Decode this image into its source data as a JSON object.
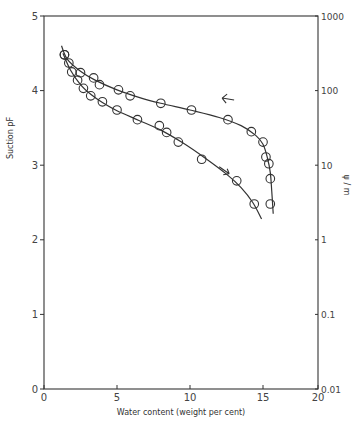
{
  "chart_data": {
    "type": "line",
    "title": "",
    "xlabel": "Water content (weight per cent)",
    "ylabel": "Suction pF",
    "y2label": "ψ / m",
    "xlim": [
      0,
      20
    ],
    "ylim": [
      0,
      5
    ],
    "x_ticks": [
      0,
      5,
      10,
      15,
      20
    ],
    "x_tick_labels": [
      "0",
      "5",
      "10",
      "15",
      "20"
    ],
    "y_ticks": [
      0,
      1,
      2,
      3,
      4,
      5
    ],
    "y_tick_labels": [
      "0",
      "1",
      "2",
      "3",
      "4",
      "5"
    ],
    "y2_ticks": [
      0,
      1,
      2,
      3,
      4,
      5
    ],
    "y2_tick_labels": [
      "0.01",
      "0.1",
      "1",
      "10",
      "100",
      "1000"
    ],
    "grid": false,
    "legend": "none",
    "series": [
      {
        "name": "drying (arrow ←)",
        "marker": "open-circle",
        "annotation": "←",
        "annotation_pos": [
          12.2,
          3.9
        ],
        "x": [
          1.4,
          1.7,
          2.5,
          3.4,
          3.8,
          5.1,
          5.9,
          8.0,
          10.1,
          12.6,
          14.2,
          15.0,
          15.2,
          15.4,
          15.5,
          15.5
        ],
        "y": [
          4.48,
          4.37,
          4.24,
          4.17,
          4.08,
          4.01,
          3.93,
          3.83,
          3.74,
          3.61,
          3.45,
          3.31,
          3.11,
          3.02,
          2.82,
          2.48
        ],
        "curve_x": [
          1.2,
          1.6,
          2.5,
          3.5,
          5.0,
          6.5,
          8.0,
          10.0,
          12.0,
          13.5,
          14.5,
          15.0,
          15.3,
          15.5,
          15.6,
          15.7
        ],
        "curve_y": [
          4.6,
          4.42,
          4.26,
          4.14,
          4.01,
          3.91,
          3.83,
          3.74,
          3.64,
          3.53,
          3.4,
          3.28,
          3.1,
          2.9,
          2.65,
          2.35
        ]
      },
      {
        "name": "wetting (arrow →)",
        "marker": "open-circle",
        "annotation": "↘",
        "annotation_pos": [
          12.0,
          2.98
        ],
        "x": [
          1.4,
          1.9,
          2.3,
          2.7,
          3.2,
          4.0,
          5.0,
          6.4,
          7.9,
          8.4,
          9.2,
          10.8,
          13.2,
          14.4
        ],
        "y": [
          4.48,
          4.25,
          4.14,
          4.03,
          3.93,
          3.85,
          3.74,
          3.61,
          3.53,
          3.44,
          3.31,
          3.08,
          2.79,
          2.48
        ],
        "curve_x": [
          1.3,
          1.8,
          2.5,
          3.2,
          4.0,
          5.0,
          6.5,
          8.0,
          9.5,
          11.0,
          12.5,
          13.5,
          14.3,
          14.9
        ],
        "curve_y": [
          4.5,
          4.28,
          4.08,
          3.95,
          3.84,
          3.73,
          3.6,
          3.47,
          3.3,
          3.1,
          2.88,
          2.7,
          2.5,
          2.28
        ]
      }
    ]
  },
  "layout": {
    "plot_left": 44,
    "plot_right": 318,
    "plot_top": 16,
    "plot_bottom": 389,
    "x_scale_px_per_unit": 14.6,
    "colors": {
      "ink": "#333333",
      "background": "#ffffff"
    }
  }
}
